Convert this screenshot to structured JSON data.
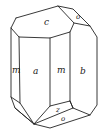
{
  "diagram": {
    "type": "crystal-habit",
    "colors": {
      "line": "#222222",
      "background": "#ffffff"
    },
    "faces": [
      {
        "id": "c",
        "label": "c",
        "x": 44,
        "y": 25,
        "size": 9
      },
      {
        "id": "o_top",
        "label": "o",
        "x": 76,
        "y": 19,
        "size": 7
      },
      {
        "id": "m_left",
        "label": "m",
        "x": 13,
        "y": 73,
        "size": 9
      },
      {
        "id": "a",
        "label": "a",
        "x": 35,
        "y": 74,
        "size": 9
      },
      {
        "id": "m_mid",
        "label": "m",
        "x": 61,
        "y": 73,
        "size": 9
      },
      {
        "id": "b",
        "label": "b",
        "x": 82,
        "y": 74,
        "size": 9
      },
      {
        "id": "z",
        "label": "z",
        "x": 58,
        "y": 112,
        "size": 7
      },
      {
        "id": "o_bottom",
        "label": "o",
        "x": 63,
        "y": 123,
        "size": 7
      }
    ]
  }
}
